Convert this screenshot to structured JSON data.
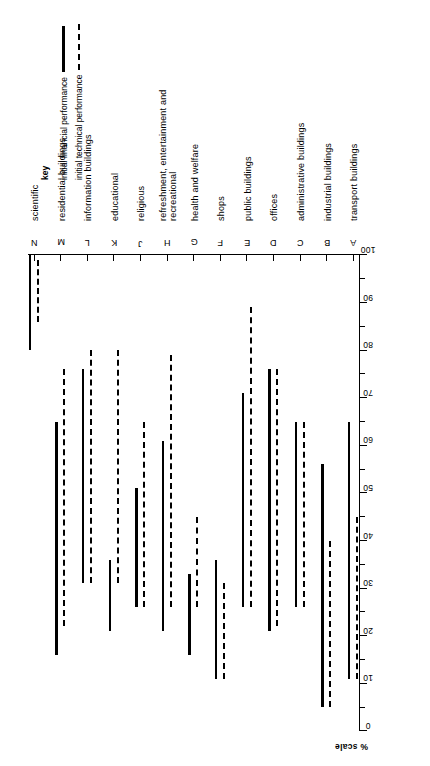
{
  "figure": {
    "orientation": "rotated-90-ccw",
    "axis_label": "%  scale",
    "value_axis": {
      "min": 0,
      "max": 100,
      "tick_step": 10,
      "minor_step": 5,
      "ticks": [
        0,
        10,
        20,
        30,
        40,
        50,
        60,
        70,
        80,
        90,
        100
      ]
    },
    "ink_color": "#000000",
    "background": "#ffffff"
  },
  "legend": {
    "title": "key",
    "entries": [
      {
        "label": "initial financial performance",
        "style": "solid"
      },
      {
        "label": "initial technical performance",
        "style": "dashed"
      }
    ]
  },
  "chart_data": {
    "type": "bar",
    "title": "",
    "subtitle": "",
    "xlabel": "% scale",
    "ylabel": "",
    "xlim": [
      0,
      100
    ],
    "grid": false,
    "legend_position": "right",
    "note": "Floating range bars: each category shows a solid bar (initial financial performance) and a dashed bar (initial technical performance) spanning a low-to-high percentage range.",
    "categories": [
      {
        "code": "N",
        "label": "scientific"
      },
      {
        "code": "M",
        "label": "residential buildings"
      },
      {
        "code": "L",
        "label": "information buildings"
      },
      {
        "code": "K",
        "label": "educational"
      },
      {
        "code": "J",
        "label": "religious"
      },
      {
        "code": "H",
        "label": "refreshment, entertainment and\nrecreational"
      },
      {
        "code": "G",
        "label": "health and welfare"
      },
      {
        "code": "F",
        "label": "shops"
      },
      {
        "code": "E",
        "label": "public buildings"
      },
      {
        "code": "D",
        "label": "offices"
      },
      {
        "code": "C",
        "label": "administrative buildings"
      },
      {
        "code": "B",
        "label": "industrial buildings"
      },
      {
        "code": "A",
        "label": "transport buildings"
      }
    ],
    "series": [
      {
        "name": "initial financial performance",
        "style": "solid",
        "ranges": [
          {
            "category": "N",
            "low": 80,
            "high": 100
          },
          {
            "category": "M",
            "low": 16,
            "high": 65
          },
          {
            "category": "L",
            "low": 31,
            "high": 76
          },
          {
            "category": "K",
            "low": 21,
            "high": 36
          },
          {
            "category": "J",
            "low": 26,
            "high": 51
          },
          {
            "category": "H",
            "low": 21,
            "high": 61
          },
          {
            "category": "G",
            "low": 16,
            "high": 33
          },
          {
            "category": "F",
            "low": 11,
            "high": 36
          },
          {
            "category": "E",
            "low": 26,
            "high": 71
          },
          {
            "category": "D",
            "low": 21,
            "high": 76
          },
          {
            "category": "C",
            "low": 26,
            "high": 65
          },
          {
            "category": "B",
            "low": 5,
            "high": 56
          },
          {
            "category": "A",
            "low": 11,
            "high": 65
          }
        ]
      },
      {
        "name": "initial technical performance",
        "style": "dashed",
        "ranges": [
          {
            "category": "N",
            "low": 86,
            "high": 99
          },
          {
            "category": "M",
            "low": 22,
            "high": 76
          },
          {
            "category": "L",
            "low": 31,
            "high": 80
          },
          {
            "category": "K",
            "low": 31,
            "high": 80
          },
          {
            "category": "J",
            "low": 26,
            "high": 65
          },
          {
            "category": "H",
            "low": 26,
            "high": 79
          },
          {
            "category": "G",
            "low": 26,
            "high": 45
          },
          {
            "category": "F",
            "low": 11,
            "high": 31
          },
          {
            "category": "E",
            "low": 26,
            "high": 89
          },
          {
            "category": "D",
            "low": 22,
            "high": 76
          },
          {
            "category": "C",
            "low": 26,
            "high": 65
          },
          {
            "category": "B",
            "low": 5,
            "high": 40
          },
          {
            "category": "A",
            "low": 11,
            "high": 45
          }
        ]
      }
    ]
  }
}
